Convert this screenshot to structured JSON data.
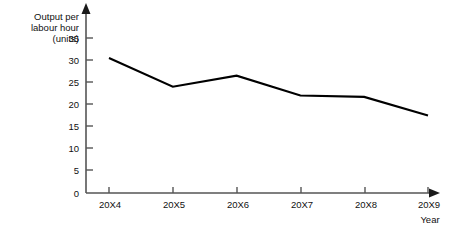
{
  "chart_data": {
    "type": "line",
    "title": "",
    "xlabel": "Year",
    "ylabel": "Output per labour hour (units)",
    "ylabel_lines": [
      "Output per",
      "labour hour",
      "(units)"
    ],
    "categories": [
      "20X4",
      "20X5",
      "20X6",
      "20X7",
      "20X8",
      "20X9"
    ],
    "values": [
      30.5,
      24,
      26.5,
      22,
      21.7,
      17.5
    ],
    "series": [
      {
        "name": "Output per labour hour",
        "values": [
          30.5,
          24,
          26.5,
          22,
          21.7,
          17.5
        ],
        "color": "#000000"
      }
    ],
    "ylim": [
      0,
      37
    ],
    "yticks": [
      0,
      5,
      10,
      15,
      20,
      25,
      30,
      35
    ],
    "ytick_labels": [
      "0",
      "5",
      "10",
      "15",
      "20",
      "25",
      "30",
      "35"
    ],
    "xtick_labels": [
      "20X4",
      "20X5",
      "20X6",
      "20X7",
      "20X8",
      "20X9"
    ],
    "grid": false,
    "legend": false,
    "legend_position": "none",
    "axis_arrows": true,
    "line_color": "#000000",
    "axis_color": "#444444",
    "background_color": "#ffffff"
  },
  "axes": {
    "y_title_line_1": "Output per",
    "y_title_line_2": "labour hour",
    "y_title_line_3": "(units)",
    "x_title": "Year"
  },
  "ticks": {
    "y": [
      "35",
      "30",
      "25",
      "20",
      "15",
      "10",
      "5",
      "0"
    ],
    "x": [
      "20X4",
      "20X5",
      "20X6",
      "20X7",
      "20X8",
      "20X9"
    ]
  }
}
